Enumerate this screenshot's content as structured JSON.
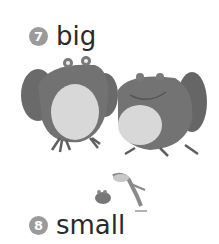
{
  "items": [
    {
      "number": "7",
      "word": "big"
    },
    {
      "number": "8",
      "word": "small"
    }
  ],
  "illustrations": {
    "big": "two large toads sitting",
    "small": "small frog sitting and small frog leaping"
  },
  "colors": {
    "badge": "#9b9b9b",
    "text": "#2a2a2a",
    "frog_body": "#6f6f6f",
    "frog_belly": "#d6d6d6"
  }
}
